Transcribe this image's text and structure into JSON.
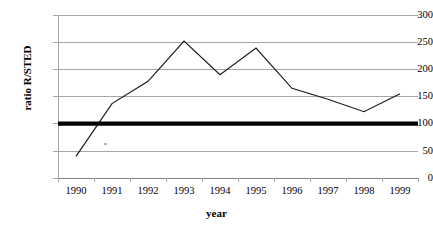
{
  "chart_data": {
    "type": "line",
    "title": "",
    "xlabel": "year",
    "ylabel": "ratio R/STED",
    "categories": [
      "1990",
      "1991",
      "1992",
      "1993",
      "1994",
      "1995",
      "1996",
      "1997",
      "1998",
      "1999"
    ],
    "values": [
      40,
      137,
      178,
      252,
      190,
      239,
      165,
      145,
      122,
      155
    ],
    "series": [
      {
        "name": "ratio R/STED",
        "values": [
          40,
          137,
          178,
          252,
          190,
          239,
          165,
          145,
          122,
          155
        ],
        "color": "#1a1a1a"
      },
      {
        "name": "reference-level",
        "type": "horizontal-line",
        "value": 100,
        "color": "#000000"
      }
    ],
    "ylim": [
      0,
      300
    ],
    "yticks": [
      0,
      50,
      100,
      150,
      200,
      250,
      300
    ],
    "ytick_labels": [
      "0",
      "50",
      "100",
      "150",
      "200",
      "250",
      "300"
    ],
    "grid": "horizontal",
    "gridline_color": "#a6a6a6",
    "legend": "none",
    "axis_color": "#a6a6a6",
    "background": "#ffffff"
  }
}
